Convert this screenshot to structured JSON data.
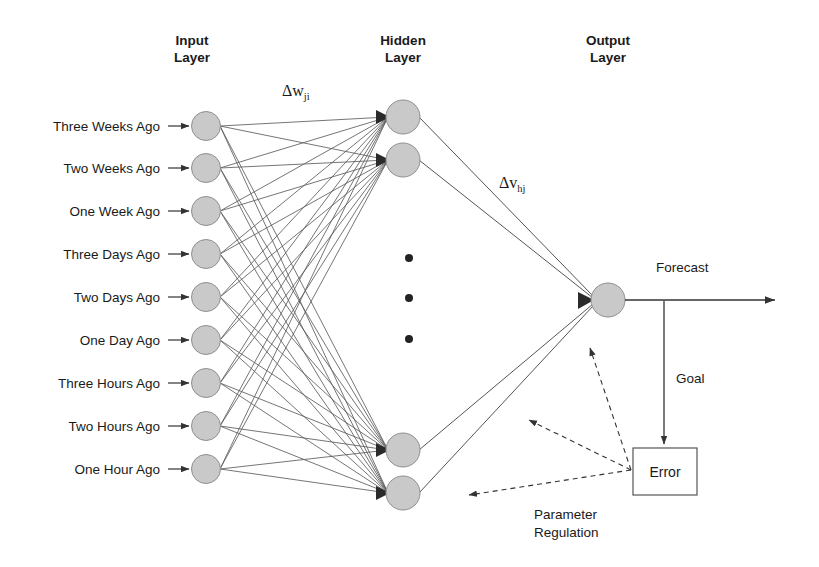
{
  "figure": {
    "background_color": "#ffffff",
    "node_fill_color": "#c9c9c9",
    "node_stroke_color": "#8a8a8a",
    "line_color": "#4d4d4d",
    "text_color": "#1a1a1a"
  },
  "headings": {
    "input": "Input\nLayer",
    "hidden": "Hidden\nLayer",
    "output": "Output\nLayer"
  },
  "input_layer": {
    "name": "Input Layer",
    "node_count": 9,
    "labels": [
      "Three Weeks Ago",
      "Two Weeks Ago",
      "One Week Ago",
      "Three Days Ago",
      "Two Days Ago",
      "One Day Ago",
      "Three Hours Ago",
      "Two Hours Ago",
      "One Hour Ago"
    ]
  },
  "hidden_layer": {
    "name": "Hidden Layer",
    "visible_node_count": 4,
    "ellipsis_dots": 3,
    "ellipsis_meaning": "additional hidden neurons omitted"
  },
  "output_layer": {
    "name": "Output Layer",
    "node_count": 1
  },
  "edge_labels": {
    "input_to_hidden": {
      "symbol": "Δw",
      "subscript": "ji"
    },
    "hidden_to_output": {
      "symbol": "Δv",
      "subscript": "hj"
    }
  },
  "flow_labels": {
    "forecast": "Forecast",
    "goal": "Goal",
    "error": "Error",
    "parameter_regulation": "Parameter\nRegulation"
  },
  "chart_data": {
    "type": "diagram",
    "layers": [
      {
        "name": "Input Layer",
        "nodes": [
          "Three Weeks Ago",
          "Two Weeks Ago",
          "One Week Ago",
          "Three Days Ago",
          "Two Days Ago",
          "One Day Ago",
          "Three Hours Ago",
          "Two Hours Ago",
          "One Hour Ago"
        ]
      },
      {
        "name": "Hidden Layer",
        "nodes": [
          "h1",
          "h2",
          "...",
          "hn-1",
          "hn"
        ]
      },
      {
        "name": "Output Layer",
        "nodes": [
          "Forecast"
        ]
      }
    ],
    "connections": [
      {
        "from": "Input Layer",
        "to": "Hidden Layer",
        "label": "Δw_ji",
        "style": "solid",
        "fully_connected": true
      },
      {
        "from": "Hidden Layer",
        "to": "Output Layer",
        "label": "Δv_hj",
        "style": "solid",
        "fully_connected": true
      },
      {
        "from": "Output Layer",
        "to": "Forecast",
        "label": "Forecast",
        "style": "solid"
      },
      {
        "from": "Output Layer",
        "to": "Error",
        "label": "Goal",
        "style": "solid"
      },
      {
        "from": "Error",
        "to": "Hidden Layer",
        "label": "Parameter Regulation",
        "style": "dashed"
      },
      {
        "from": "Error",
        "to": "Input Layer",
        "label": "Parameter Regulation",
        "style": "dashed"
      }
    ]
  }
}
